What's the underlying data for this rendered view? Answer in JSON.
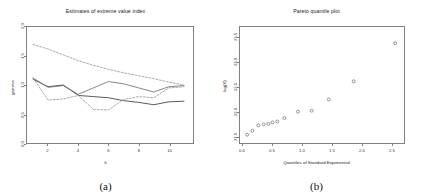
{
  "figure": {
    "panels": [
      {
        "caption": "(a)",
        "title": "Estimates of extreme value index",
        "chart_data": {
          "type": "line",
          "title": "Estimates of extreme value index",
          "xlabel": "k",
          "ylabel": "gamma",
          "xlim": [
            0.6,
            11.6
          ],
          "ylim": [
            0.0,
            2.0
          ],
          "xticks": [
            "2",
            "4",
            "6",
            "8",
            "10"
          ],
          "xtick_values": [
            2,
            4,
            6,
            8,
            10
          ],
          "yticks": [
            "0.0",
            "0.5",
            "1.0",
            "1.5",
            "2.0"
          ],
          "ytick_values": [
            0.0,
            0.5,
            1.0,
            1.5,
            2.0
          ],
          "grid": false,
          "legend": "none",
          "x": [
            1,
            2,
            3,
            4,
            5,
            6,
            7,
            8,
            9,
            10,
            11
          ],
          "series": [
            {
              "name": "Hill estimator",
              "style": "solid",
              "color": "#3b3b3b",
              "values": [
                1.1,
                0.97,
                1.0,
                0.82,
                0.8,
                0.78,
                0.73,
                0.7,
                0.66,
                0.71,
                0.72
              ]
            },
            {
              "name": "Moment estimator",
              "style": "solid",
              "color": "#6e6e6e",
              "values": [
                1.12,
                0.96,
                0.99,
                0.84,
                0.95,
                1.06,
                1.02,
                0.95,
                0.88,
                0.97,
                0.99
              ]
            },
            {
              "name": "Upper confidence band",
              "style": "dashed",
              "color": "#9a9a9a",
              "values": [
                1.7,
                1.62,
                1.52,
                1.42,
                1.34,
                1.27,
                1.21,
                1.16,
                1.11,
                1.05,
                1.0
              ]
            },
            {
              "name": "Lower confidence band",
              "style": "dashed",
              "color": "#9a9a9a",
              "values": [
                1.12,
                0.74,
                0.76,
                0.82,
                0.58,
                0.57,
                0.75,
                0.8,
                0.78,
                0.95,
                0.97
              ]
            }
          ]
        }
      },
      {
        "caption": "(b)",
        "title": "Pareto quantile plot",
        "chart_data": {
          "type": "scatter",
          "title": "Pareto quantile plot",
          "xlabel": "Quantiles of Standard Exponential",
          "ylabel": "log(X)",
          "xlim": [
            -0.05,
            2.72
          ],
          "ylim": [
            21.35,
            23.72
          ],
          "xticks": [
            "0.0",
            "0.5",
            "1.0",
            "1.5",
            "2.0",
            "2.5"
          ],
          "xtick_values": [
            0.0,
            0.5,
            1.0,
            1.5,
            2.0,
            2.5
          ],
          "yticks": [
            "21.5",
            "22.0",
            "22.5",
            "23.0",
            "23.5"
          ],
          "ytick_values": [
            21.5,
            22.0,
            22.5,
            23.0,
            23.5
          ],
          "grid": false,
          "legend": "none",
          "marker": "open-circle",
          "marker_color": "#555555",
          "points": [
            {
              "x": 0.07,
              "y": 21.52
            },
            {
              "x": 0.16,
              "y": 21.6
            },
            {
              "x": 0.26,
              "y": 21.71
            },
            {
              "x": 0.35,
              "y": 21.73
            },
            {
              "x": 0.43,
              "y": 21.74
            },
            {
              "x": 0.5,
              "y": 21.77
            },
            {
              "x": 0.58,
              "y": 21.79
            },
            {
              "x": 0.7,
              "y": 21.86
            },
            {
              "x": 0.93,
              "y": 21.99
            },
            {
              "x": 1.16,
              "y": 22.01
            },
            {
              "x": 1.45,
              "y": 22.24
            },
            {
              "x": 1.87,
              "y": 22.61
            },
            {
              "x": 2.57,
              "y": 23.39
            }
          ]
        }
      }
    ]
  }
}
